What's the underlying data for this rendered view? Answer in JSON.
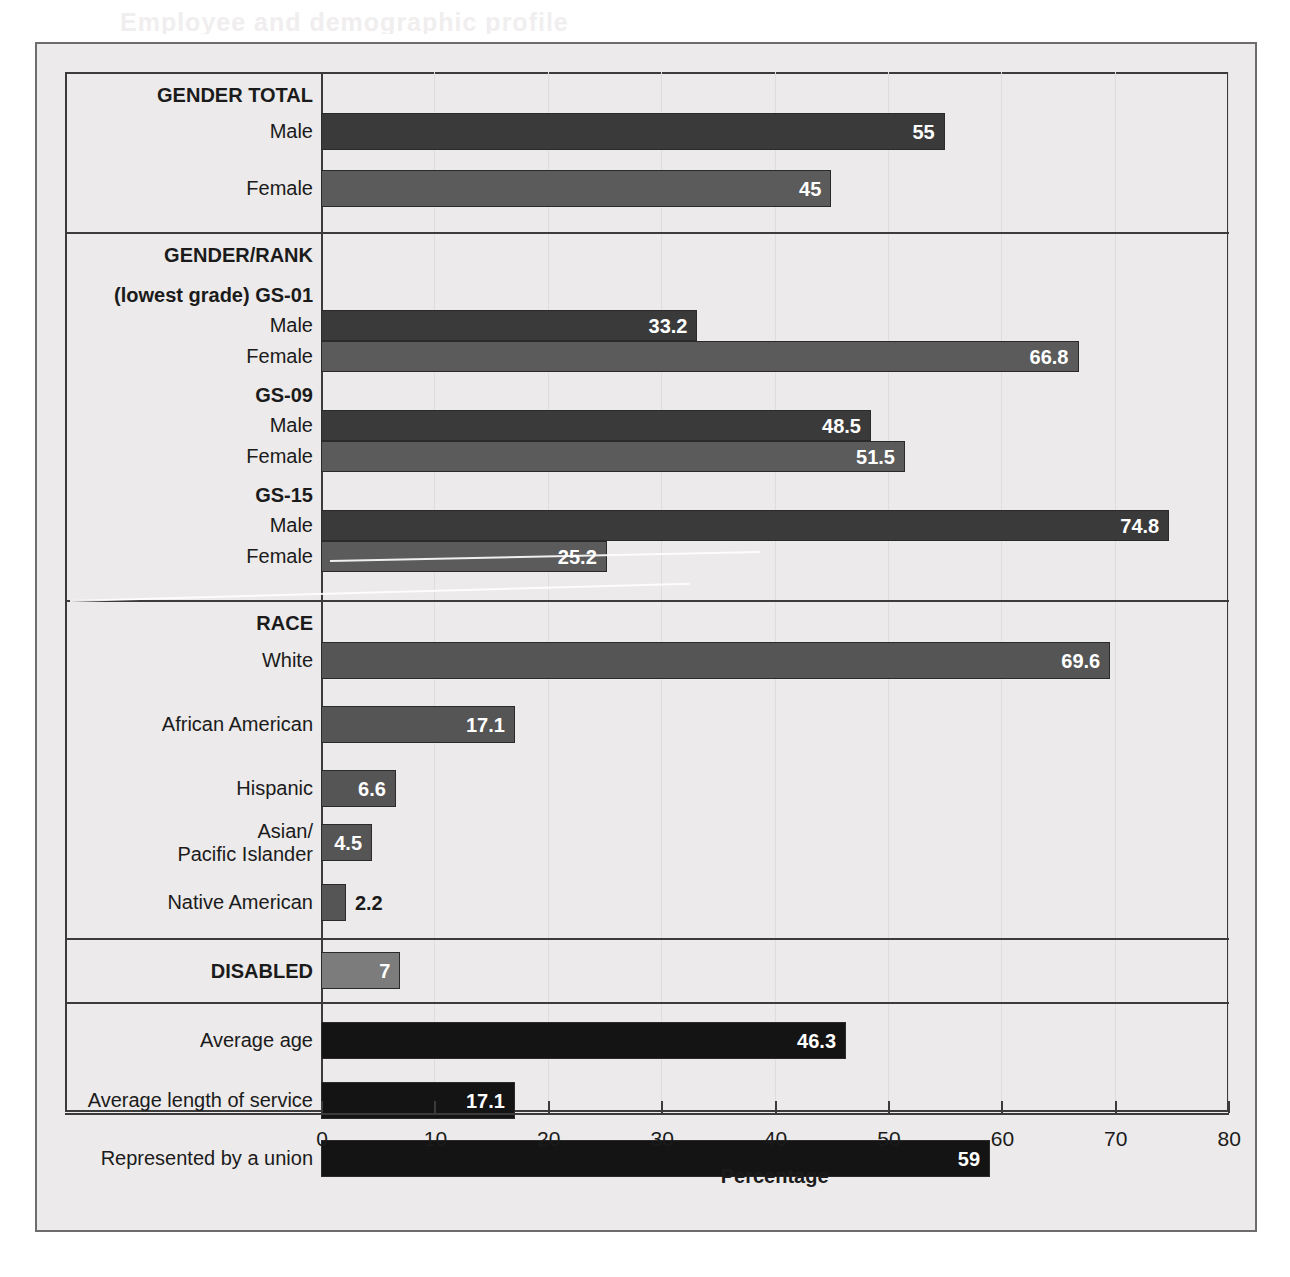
{
  "figure": {
    "bleed_text": "Employee and demographic profile",
    "x_axis_title": "Percentage",
    "x_ticks": [
      0,
      10,
      20,
      30,
      40,
      50,
      60,
      70,
      80
    ]
  },
  "colors": {
    "male_bar": "#3a3a3a",
    "female_bar": "#5b5b5b",
    "race_bar": "#555555",
    "disabled_bar": "#7c7c7c",
    "other_bar": "#141414",
    "frame": "#3b3b3b",
    "background": "#eceaea",
    "label_text": "#1b1b1b",
    "value_text": "#ffffff"
  },
  "chart_data": {
    "type": "bar",
    "orientation": "horizontal",
    "title": "",
    "xlabel": "Percentage",
    "ylabel": "",
    "xlim": [
      0,
      80
    ],
    "xticks": [
      0,
      10,
      20,
      30,
      40,
      50,
      60,
      70,
      80
    ],
    "grid": true,
    "legend": "none",
    "sections": [
      {
        "heading": "GENDER TOTAL",
        "bars": [
          {
            "label": "Male",
            "value": 55,
            "value_label": "55",
            "style": "male",
            "label_inside": true
          },
          {
            "label": "Female",
            "value": 45,
            "value_label": "45",
            "style": "female",
            "label_inside": true
          }
        ]
      },
      {
        "heading": "GENDER/RANK",
        "subheading": "(lowest grade) GS-01",
        "groups": [
          {
            "group_label": "(lowest grade) GS-01",
            "bars": [
              {
                "label": "Male",
                "value": 33.2,
                "value_label": "33.2",
                "style": "male",
                "label_inside": true
              },
              {
                "label": "Female",
                "value": 66.8,
                "value_label": "66.8",
                "style": "female",
                "label_inside": true
              }
            ]
          },
          {
            "group_label": "GS-09",
            "bars": [
              {
                "label": "Male",
                "value": 48.5,
                "value_label": "48.5",
                "style": "male",
                "label_inside": true
              },
              {
                "label": "Female",
                "value": 51.5,
                "value_label": "51.5",
                "style": "female",
                "label_inside": true
              }
            ]
          },
          {
            "group_label": "GS-15",
            "bars": [
              {
                "label": "Male",
                "value": 74.8,
                "value_label": "74.8",
                "style": "male",
                "label_inside": true
              },
              {
                "label": "Female",
                "value": 25.2,
                "value_label": "25.2",
                "style": "female",
                "label_inside": true
              }
            ]
          }
        ]
      },
      {
        "heading": "RACE",
        "bars": [
          {
            "label": "White",
            "value": 69.6,
            "value_label": "69.6",
            "style": "race",
            "label_inside": true
          },
          {
            "label": "African American",
            "value": 17.1,
            "value_label": "17.1",
            "style": "race",
            "label_inside": true
          },
          {
            "label": "Hispanic",
            "value": 6.6,
            "value_label": "6.6",
            "style": "race",
            "label_inside": true
          },
          {
            "label": "Asian/\nPacific Islander",
            "value": 4.5,
            "value_label": "4.5",
            "style": "race",
            "label_inside": true
          },
          {
            "label": "Native American",
            "value": 2.2,
            "value_label": "2.2",
            "style": "race",
            "label_inside": false
          }
        ]
      },
      {
        "heading": "DISABLED",
        "heading_is_bar": true,
        "bars": [
          {
            "label": "DISABLED",
            "value": 7,
            "value_label": "7",
            "style": "disabled",
            "label_inside": true
          }
        ]
      },
      {
        "heading": "",
        "bars": [
          {
            "label": "Average age",
            "value": 46.3,
            "value_label": "46.3",
            "style": "other",
            "label_inside": true
          },
          {
            "label": "Average length of service",
            "value": 17.1,
            "value_label": "17.1",
            "style": "other",
            "label_inside": true
          },
          {
            "label": "Represented by a union",
            "value": 59,
            "value_label": "59",
            "style": "other",
            "label_inside": true
          }
        ]
      }
    ],
    "labels": [
      "Male",
      "Female",
      "Male",
      "Female",
      "Male",
      "Female",
      "Male",
      "Female",
      "White",
      "African American",
      "Hispanic",
      "Asian/Pacific Islander",
      "Native American",
      "DISABLED",
      "Average age",
      "Average length of service",
      "Represented by a union"
    ],
    "values": [
      55,
      45,
      33.2,
      66.8,
      48.5,
      51.5,
      74.8,
      25.2,
      69.6,
      17.1,
      6.6,
      4.5,
      2.2,
      7,
      46.3,
      17.1,
      59
    ]
  },
  "layout": {
    "axis_x_px": 256,
    "px_per_unit": 11.34,
    "rows": [
      {
        "kind": "heading",
        "text": "GENDER TOTAL",
        "y": 12
      },
      {
        "kind": "bar",
        "idx": 0,
        "y": 41,
        "h": 37
      },
      {
        "kind": "bar",
        "idx": 1,
        "y": 98,
        "h": 37
      },
      {
        "kind": "rule",
        "y": 160
      },
      {
        "kind": "heading",
        "text": "GENDER/RANK",
        "y": 172
      },
      {
        "kind": "heading",
        "text": "(lowest grade) GS-01",
        "y": 212
      },
      {
        "kind": "bar",
        "idx": 2,
        "y": 238,
        "h": 31
      },
      {
        "kind": "bar",
        "idx": 3,
        "y": 269,
        "h": 31
      },
      {
        "kind": "heading",
        "text": "GS-09",
        "y": 312
      },
      {
        "kind": "bar",
        "idx": 4,
        "y": 338,
        "h": 31
      },
      {
        "kind": "bar",
        "idx": 5,
        "y": 369,
        "h": 31
      },
      {
        "kind": "heading",
        "text": "GS-15",
        "y": 412
      },
      {
        "kind": "bar",
        "idx": 6,
        "y": 438,
        "h": 31
      },
      {
        "kind": "bar",
        "idx": 7,
        "y": 469,
        "h": 31
      },
      {
        "kind": "rule",
        "y": 528
      },
      {
        "kind": "heading",
        "text": "RACE",
        "y": 540
      },
      {
        "kind": "bar",
        "idx": 8,
        "y": 570,
        "h": 37
      },
      {
        "kind": "bar",
        "idx": 9,
        "y": 634,
        "h": 37
      },
      {
        "kind": "bar",
        "idx": 10,
        "y": 698,
        "h": 37
      },
      {
        "kind": "bar",
        "idx": 11,
        "y": 752,
        "h": 37
      },
      {
        "kind": "bar",
        "idx": 12,
        "y": 812,
        "h": 37
      },
      {
        "kind": "rule",
        "y": 866
      },
      {
        "kind": "bar",
        "idx": 13,
        "y": 880,
        "h": 37
      },
      {
        "kind": "rule",
        "y": 930
      },
      {
        "kind": "bar",
        "idx": 14,
        "y": 950,
        "h": 37
      },
      {
        "kind": "bar",
        "idx": 15,
        "y": 1010,
        "h": 37
      },
      {
        "kind": "bar",
        "idx": 16,
        "y": 1068,
        "h": 37
      }
    ]
  }
}
